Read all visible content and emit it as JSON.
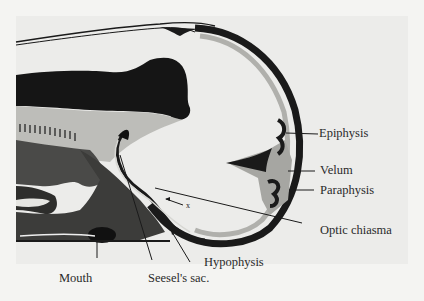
{
  "figure": {
    "colors": {
      "background": "#f4f4f2",
      "plate": "#ececea",
      "ink": "#1a1a1a",
      "gray_fill": "#9a9a98",
      "light_gray": "#c8c8c4"
    },
    "labels": {
      "epiphysis": "Epiphysis",
      "velum": "Velum",
      "paraphysis": "Paraphysis",
      "optic_chiasma": "Optic chiasma",
      "hypophysis": "Hypophysis",
      "seesels_sac": "Seesel's sac.",
      "mouth": "Mouth",
      "x_marker": "x"
    }
  }
}
